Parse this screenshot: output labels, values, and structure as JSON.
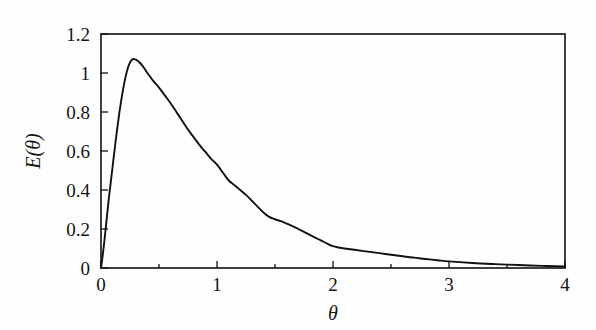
{
  "figure": {
    "background_color": "#fefefe",
    "ink_color": "#111111"
  },
  "chart_data": {
    "type": "line",
    "title": "",
    "subtitle": "",
    "xlabel": "θ",
    "ylabel": "E(θ)",
    "xlim": [
      0,
      4
    ],
    "ylim": [
      0,
      1.2
    ],
    "grid": false,
    "legend": null,
    "legend_position": "none",
    "x_major_ticks": [
      0,
      1,
      2,
      3,
      4
    ],
    "x_major_tick_labels": [
      "0",
      "1",
      "2",
      "3",
      "4"
    ],
    "x_minor_ticks": [
      0.5,
      1.5,
      2.5,
      3.5
    ],
    "y_major_ticks": [
      0,
      0.2,
      0.4,
      0.6,
      0.8,
      1,
      1.2
    ],
    "y_major_tick_labels": [
      "0",
      "0.2",
      "0.4",
      "0.6",
      "0.8",
      "1",
      "1.2"
    ],
    "y_minor_ticks": [],
    "tick_direction": "in",
    "axis_frame": "box",
    "series": [
      {
        "name": "E(θ)",
        "color": "#111111",
        "line_width": 1.9,
        "marker": "none",
        "x": [
          0.0,
          0.02,
          0.04,
          0.06,
          0.09,
          0.12,
          0.15,
          0.18,
          0.21,
          0.24,
          0.27,
          0.3,
          0.33,
          0.36,
          0.4,
          0.45,
          0.5,
          0.55,
          0.6,
          0.65,
          0.7,
          0.75,
          0.8,
          0.85,
          0.9,
          0.95,
          1.0,
          1.05,
          1.1,
          1.15,
          1.2,
          1.25,
          1.3,
          1.35,
          1.4,
          1.45,
          1.5,
          1.55,
          1.6,
          1.65,
          1.7,
          1.75,
          1.8,
          1.85,
          1.9,
          1.95,
          2.0,
          2.05,
          2.1,
          2.2,
          2.3,
          2.4,
          2.5,
          2.6,
          2.7,
          2.8,
          2.9,
          3.0,
          3.2,
          3.4,
          3.6,
          3.8,
          4.0
        ],
        "y": [
          0.0,
          0.09,
          0.2,
          0.315,
          0.47,
          0.62,
          0.76,
          0.88,
          0.975,
          1.04,
          1.07,
          1.068,
          1.055,
          1.035,
          1.0,
          0.96,
          0.925,
          0.885,
          0.845,
          0.8,
          0.755,
          0.71,
          0.67,
          0.63,
          0.595,
          0.56,
          0.53,
          0.49,
          0.45,
          0.425,
          0.4,
          0.375,
          0.345,
          0.315,
          0.285,
          0.262,
          0.25,
          0.24,
          0.228,
          0.215,
          0.2,
          0.185,
          0.17,
          0.155,
          0.14,
          0.125,
          0.112,
          0.105,
          0.1,
          0.092,
          0.084,
          0.076,
          0.068,
          0.06,
          0.053,
          0.046,
          0.04,
          0.034,
          0.026,
          0.02,
          0.015,
          0.011,
          0.008
        ]
      }
    ],
    "annotations": []
  }
}
